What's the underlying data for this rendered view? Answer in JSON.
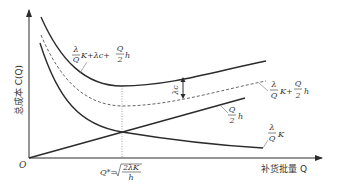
{
  "figure": {
    "y_axis_label": "总成本 C(Q)",
    "x_axis_label": "补货批量 Q",
    "origin_label": "O",
    "optimal_q_label": {
      "prefix": "Q* =",
      "numerator": "2λK",
      "denominator": "h"
    },
    "gap_label": "λc",
    "curves": [
      {
        "id": "total-with-purchase",
        "label": {
          "frac_num": "λ",
          "frac_den": "Q",
          "rest": "K+λc+",
          "frac2_num": "Q",
          "frac2_den": "2",
          "tail": "h"
        },
        "style": "solid"
      },
      {
        "id": "total-inventory",
        "label": {
          "frac_num": "λ",
          "frac_den": "Q",
          "rest": "K+",
          "frac2_num": "Q",
          "frac2_den": "2",
          "tail": "h"
        },
        "style": "dashed"
      },
      {
        "id": "holding-cost",
        "label": {
          "frac_num": "Q",
          "frac_den": "2",
          "tail": "h"
        },
        "style": "solid"
      },
      {
        "id": "ordering-cost",
        "label": {
          "frac_num": "λ",
          "frac_den": "Q",
          "tail": "K"
        },
        "style": "solid"
      }
    ],
    "colors": {
      "line": "#2b2b2b",
      "text": "#333333",
      "guide": "#888888"
    }
  }
}
